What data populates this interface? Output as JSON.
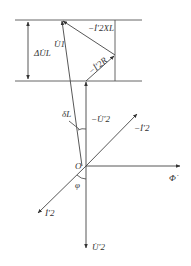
{
  "diagram": {
    "type": "phasor-diagram",
    "colors": {
      "line": "#555555",
      "vector": "#444444",
      "text": "#333333",
      "background": "#ffffff"
    },
    "labels": {
      "delta_u_l": "ΔU̇L",
      "u1": "U̇1",
      "i2_xl": "−İ′2XL",
      "i2_r": "−İ′2R",
      "delta_l": "δL",
      "neg_u2": "−U̇′2",
      "neg_i2": "−İ′2",
      "origin": "O",
      "phi_flux": "Φ̇",
      "phi_angle": "φ",
      "i2": "İ′2",
      "u2": "U̇′2"
    },
    "points": {
      "origin": [
        86,
        166
      ],
      "u1_tip": [
        62,
        20
      ],
      "neg_u2_tip": [
        86,
        81
      ],
      "i2r_tip": [
        115,
        55
      ],
      "flux_tip": [
        180,
        166
      ],
      "u2_tip": [
        86,
        248
      ],
      "neg_i2_tip": [
        137,
        113
      ],
      "i2_tip": [
        38,
        213
      ]
    }
  }
}
